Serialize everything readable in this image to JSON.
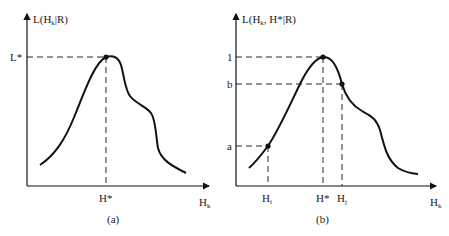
{
  "figure": {
    "panel_a": {
      "caption": "(a)",
      "y_axis_label": {
        "main": "L(H",
        "sub": "k",
        "rest": "|R)"
      },
      "x_axis_label": {
        "main": "H",
        "sub": "k"
      },
      "y_ticks": [
        {
          "label": "L*",
          "y": 57
        }
      ],
      "x_ticks": [
        {
          "label": "H*",
          "x": 106
        }
      ],
      "marked_points": [
        {
          "name": "peak",
          "x": 106,
          "y": 57
        }
      ],
      "curve_description": "Unimodal likelihood curve with maximum L* at H*, shoulder on the right side"
    },
    "panel_b": {
      "caption": "(b)",
      "y_axis_label": {
        "main": "L(H",
        "sub": "k",
        "rest": ", H*|R)"
      },
      "x_axis_label": {
        "main": "H",
        "sub": "k"
      },
      "y_ticks": [
        {
          "label": "1",
          "y": 57
        },
        {
          "label": "b",
          "y": 84
        },
        {
          "label": "a",
          "y": 146
        }
      ],
      "x_ticks": [
        {
          "label": "H",
          "sub": "i",
          "x": 268
        },
        {
          "label": "H*",
          "x": 323
        },
        {
          "label": "H",
          "sub": "j",
          "x": 342
        }
      ],
      "marked_points": [
        {
          "name": "peak",
          "x": 323,
          "y": 57
        },
        {
          "name": "point-j",
          "x": 342,
          "y": 84
        },
        {
          "name": "point-i",
          "x": 268,
          "y": 146
        }
      ],
      "curve_description": "Normalized likelihood curve with maximum 1 at H*, value b at Hj and a at Hi"
    },
    "colors": {
      "ink": "#111111",
      "background": "#ffffff"
    }
  }
}
